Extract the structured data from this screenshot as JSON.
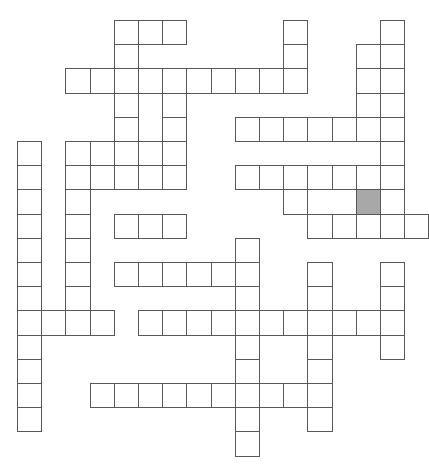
{
  "puzzle": {
    "type": "crossword-grid",
    "title": "",
    "description": "Blank crossword puzzle grid with one shaded cell",
    "geometry": {
      "origin_x": 17,
      "origin_y": 20,
      "cell_size": 24.2,
      "columns": 17,
      "rows": 18
    },
    "colors": {
      "cell_fill": "#ffffff",
      "cell_border": "#58585a",
      "shaded_fill": "#a8a8a8",
      "page_background": "#ffffff"
    },
    "counts": {
      "total_cells": 147,
      "shaded_cells": 1
    },
    "shaded_cells": [
      {
        "row": 7,
        "col": 14
      }
    ],
    "entries": [
      {
        "name": "across-r0-c4",
        "direction": "across",
        "row": 0,
        "col": 4,
        "length": 3
      },
      {
        "name": "down-r0-c11",
        "direction": "down",
        "row": 0,
        "col": 11,
        "length": 2
      },
      {
        "name": "down-r0-c15",
        "direction": "down",
        "row": 0,
        "col": 15,
        "length": 7
      },
      {
        "name": "down-r1-c14",
        "direction": "down",
        "row": 1,
        "col": 14,
        "length": 4
      },
      {
        "name": "across-r2-c2",
        "direction": "across",
        "row": 2,
        "col": 2,
        "length": 10
      },
      {
        "name": "down-r2-c4",
        "direction": "down",
        "row": 2,
        "col": 4,
        "length": 6
      },
      {
        "name": "down-r2-c6",
        "direction": "down",
        "row": 2,
        "col": 6,
        "length": 6
      },
      {
        "name": "across-r4-c9",
        "direction": "across",
        "row": 4,
        "col": 9,
        "length": 7
      },
      {
        "name": "down-r5-c11",
        "direction": "down",
        "row": 5,
        "col": 11,
        "length": 4
      },
      {
        "name": "across-r6-c2",
        "direction": "across",
        "row": 6,
        "col": 2,
        "length": 5
      },
      {
        "name": "across-r6-c9",
        "direction": "across",
        "row": 6,
        "col": 9,
        "length": 6
      },
      {
        "name": "down-r6-c2",
        "direction": "down",
        "row": 6,
        "col": 2,
        "length": 5
      },
      {
        "name": "across-r8-c4",
        "direction": "across",
        "row": 8,
        "col": 4,
        "length": 4
      },
      {
        "name": "across-r8-c12",
        "direction": "across",
        "row": 8,
        "col": 12,
        "length": 5
      },
      {
        "name": "down-r2-c1",
        "direction": "down",
        "row": 5,
        "col": 0,
        "length": 11
      },
      {
        "name": "down-r9-c9",
        "direction": "down",
        "row": 9,
        "col": 9,
        "length": 9
      },
      {
        "name": "across-r10-c4",
        "direction": "across",
        "row": 10,
        "col": 4,
        "length": 6
      },
      {
        "name": "down-r10-c12",
        "direction": "down",
        "row": 10,
        "col": 12,
        "length": 8
      },
      {
        "name": "across-r12-c0",
        "direction": "across",
        "row": 12,
        "col": 0,
        "length": 4
      },
      {
        "name": "across-r12-c5",
        "direction": "across",
        "row": 12,
        "col": 5,
        "length": 11
      },
      {
        "name": "across-r15-c3",
        "direction": "across",
        "row": 15,
        "col": 3,
        "length": 10
      }
    ],
    "cells": [
      [
        0,
        4
      ],
      [
        0,
        5
      ],
      [
        0,
        6
      ],
      [
        0,
        11
      ],
      [
        0,
        15
      ],
      [
        1,
        4
      ],
      [
        1,
        11
      ],
      [
        1,
        14
      ],
      [
        1,
        15
      ],
      [
        2,
        2
      ],
      [
        2,
        3
      ],
      [
        2,
        4
      ],
      [
        2,
        5
      ],
      [
        2,
        6
      ],
      [
        2,
        7
      ],
      [
        2,
        8
      ],
      [
        2,
        9
      ],
      [
        2,
        10
      ],
      [
        2,
        11
      ],
      [
        2,
        14
      ],
      [
        2,
        15
      ],
      [
        3,
        4
      ],
      [
        3,
        6
      ],
      [
        3,
        14
      ],
      [
        3,
        15
      ],
      [
        4,
        4
      ],
      [
        4,
        6
      ],
      [
        4,
        9
      ],
      [
        4,
        10
      ],
      [
        4,
        11
      ],
      [
        4,
        12
      ],
      [
        4,
        13
      ],
      [
        4,
        14
      ],
      [
        4,
        15
      ],
      [
        5,
        0
      ],
      [
        5,
        2
      ],
      [
        5,
        3
      ],
      [
        5,
        4
      ],
      [
        5,
        5
      ],
      [
        5,
        6
      ],
      [
        5,
        15
      ],
      [
        6,
        0
      ],
      [
        6,
        2
      ],
      [
        6,
        3
      ],
      [
        6,
        4
      ],
      [
        6,
        5
      ],
      [
        6,
        6
      ],
      [
        6,
        9
      ],
      [
        6,
        10
      ],
      [
        6,
        11
      ],
      [
        6,
        12
      ],
      [
        6,
        13
      ],
      [
        6,
        14
      ],
      [
        6,
        15
      ],
      [
        7,
        0
      ],
      [
        7,
        2
      ],
      [
        7,
        11
      ],
      [
        7,
        14
      ],
      [
        7,
        15
      ],
      [
        8,
        0
      ],
      [
        8,
        2
      ],
      [
        8,
        4
      ],
      [
        8,
        5
      ],
      [
        8,
        6
      ],
      [
        8,
        12
      ],
      [
        8,
        13
      ],
      [
        8,
        14
      ],
      [
        8,
        15
      ],
      [
        8,
        16
      ],
      [
        9,
        0
      ],
      [
        9,
        2
      ],
      [
        9,
        9
      ],
      [
        10,
        0
      ],
      [
        10,
        2
      ],
      [
        10,
        4
      ],
      [
        10,
        5
      ],
      [
        10,
        6
      ],
      [
        10,
        7
      ],
      [
        10,
        8
      ],
      [
        10,
        9
      ],
      [
        10,
        12
      ],
      [
        10,
        15
      ],
      [
        11,
        0
      ],
      [
        11,
        2
      ],
      [
        11,
        9
      ],
      [
        11,
        12
      ],
      [
        11,
        15
      ],
      [
        12,
        0
      ],
      [
        12,
        1
      ],
      [
        12,
        2
      ],
      [
        12,
        3
      ],
      [
        12,
        5
      ],
      [
        12,
        6
      ],
      [
        12,
        7
      ],
      [
        12,
        8
      ],
      [
        12,
        9
      ],
      [
        12,
        10
      ],
      [
        12,
        11
      ],
      [
        12,
        12
      ],
      [
        12,
        13
      ],
      [
        12,
        14
      ],
      [
        12,
        15
      ],
      [
        13,
        0
      ],
      [
        13,
        9
      ],
      [
        13,
        12
      ],
      [
        13,
        15
      ],
      [
        14,
        0
      ],
      [
        14,
        9
      ],
      [
        14,
        12
      ],
      [
        15,
        0
      ],
      [
        15,
        3
      ],
      [
        15,
        4
      ],
      [
        15,
        5
      ],
      [
        15,
        6
      ],
      [
        15,
        7
      ],
      [
        15,
        8
      ],
      [
        15,
        9
      ],
      [
        15,
        10
      ],
      [
        15,
        11
      ],
      [
        15,
        12
      ],
      [
        16,
        0
      ],
      [
        16,
        9
      ],
      [
        16,
        12
      ],
      [
        17,
        9
      ]
    ]
  }
}
